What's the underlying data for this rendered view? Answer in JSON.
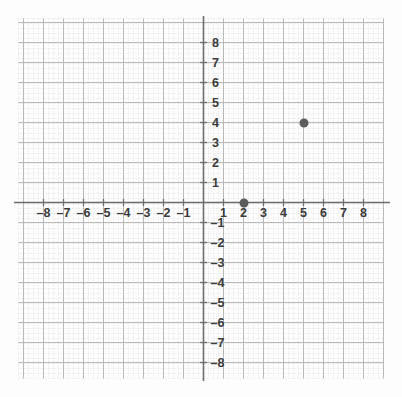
{
  "chart_data": {
    "type": "scatter",
    "title": "",
    "xlabel": "",
    "ylabel": "",
    "xlim": [
      -9,
      9
    ],
    "ylim": [
      -9,
      9
    ],
    "grid": true,
    "minor_grid": true,
    "minor_divisions": 4,
    "legend": "none",
    "x_ticks": [
      -8,
      -7,
      -6,
      -5,
      -4,
      -3,
      -2,
      -1,
      1,
      2,
      3,
      4,
      5,
      6,
      7,
      8
    ],
    "y_ticks": [
      -8,
      -7,
      -6,
      -5,
      -4,
      -3,
      -2,
      -1,
      1,
      2,
      3,
      4,
      5,
      6,
      7,
      8
    ],
    "x_tick_labels": [
      "–8",
      "–7",
      "–6",
      "–5",
      "–4",
      "–3",
      "–2",
      "–1",
      "1",
      "2",
      "3",
      "4",
      "5",
      "6",
      "7",
      "8"
    ],
    "y_tick_labels": [
      "–8",
      "–7",
      "–6",
      "–5",
      "–4",
      "–3",
      "–2",
      "–1",
      "1",
      "2",
      "3",
      "4",
      "5",
      "6",
      "7",
      "8"
    ],
    "points": [
      {
        "x": 2,
        "y": 0,
        "label": "(2, 0)"
      },
      {
        "x": 5,
        "y": 4,
        "label": "(5, 4)"
      }
    ],
    "colors": {
      "point": "#5c5c5c",
      "axis": "#6e6e6e",
      "major_grid": "#b9b9b9",
      "minor_grid": "#d8d8d8",
      "label": "#3a3a3a",
      "background": "#fdfdfd"
    }
  }
}
